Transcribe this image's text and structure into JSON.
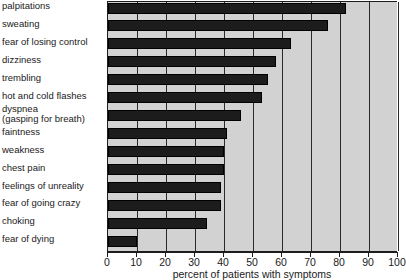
{
  "chart_data": {
    "type": "bar",
    "orientation": "horizontal",
    "title": "",
    "xlabel": "percent of patients with symptoms",
    "ylabel": "",
    "xlim": [
      0,
      100
    ],
    "xticks": [
      0,
      10,
      20,
      30,
      40,
      50,
      60,
      70,
      80,
      90,
      100
    ],
    "grid": true,
    "legend": "none",
    "categories": [
      "palpitations",
      "sweating",
      "fear of losing control",
      "dizziness",
      "trembling",
      "hot and cold flashes",
      "dyspnea (gasping for breath)",
      "faintness",
      "weakness",
      "chest pain",
      "feelings of unreality",
      "fear of going crazy",
      "choking",
      "fear of dying"
    ],
    "values": [
      82,
      76,
      63,
      58,
      55,
      53,
      46,
      41,
      40,
      40,
      39,
      39,
      34,
      10
    ]
  },
  "labels": [
    {
      "line1": "palpitations",
      "line2": ""
    },
    {
      "line1": "sweating",
      "line2": ""
    },
    {
      "line1": "fear of losing control",
      "line2": ""
    },
    {
      "line1": "dizziness",
      "line2": ""
    },
    {
      "line1": "trembling",
      "line2": ""
    },
    {
      "line1": "hot and cold flashes",
      "line2": ""
    },
    {
      "line1": "dyspnea",
      "line2": "(gasping for breath)"
    },
    {
      "line1": "faintness",
      "line2": ""
    },
    {
      "line1": "weakness",
      "line2": ""
    },
    {
      "line1": "chest pain",
      "line2": ""
    },
    {
      "line1": "feelings of unreality",
      "line2": ""
    },
    {
      "line1": "fear of going crazy",
      "line2": ""
    },
    {
      "line1": "choking",
      "line2": ""
    },
    {
      "line1": "fear of dying",
      "line2": ""
    }
  ],
  "axis": {
    "tick_labels": [
      "0",
      "10",
      "20",
      "30",
      "40",
      "50",
      "60",
      "70",
      "80",
      "90",
      "100"
    ],
    "title": "percent of patients with symptoms"
  },
  "colors": {
    "bar": "#1c1c1c",
    "plot_background": "#d2d2d2",
    "grid": "#2a2a2a",
    "axis": "#1d1d1d",
    "text": "#1a1a1a",
    "page_background": "#ffffff"
  }
}
